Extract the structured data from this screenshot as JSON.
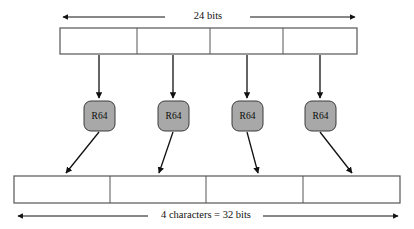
{
  "diagram": {
    "top_dimension": {
      "label": "24 bits",
      "arrow_style": "double-headed"
    },
    "bottom_dimension": {
      "label": "4 characters = 32 bits",
      "arrow_style": "double-headed"
    },
    "input_block": {
      "name": "24-bit input group",
      "segment_count": 4,
      "segments": [
        {
          "label": ""
        },
        {
          "label": ""
        },
        {
          "label": ""
        },
        {
          "label": ""
        }
      ]
    },
    "encoders": [
      {
        "label": "R64"
      },
      {
        "label": "R64"
      },
      {
        "label": "R64"
      },
      {
        "label": "R64"
      }
    ],
    "output_block": {
      "name": "4-character output group",
      "segment_count": 4,
      "segments": [
        {
          "label": ""
        },
        {
          "label": ""
        },
        {
          "label": ""
        },
        {
          "label": ""
        }
      ]
    },
    "colors": {
      "encoder_fill": "#a8a8a8",
      "encoder_stroke": "#3a3a3a",
      "box_stroke": "#555555",
      "arrow_color": "#111111",
      "background": "#ffffff"
    }
  }
}
